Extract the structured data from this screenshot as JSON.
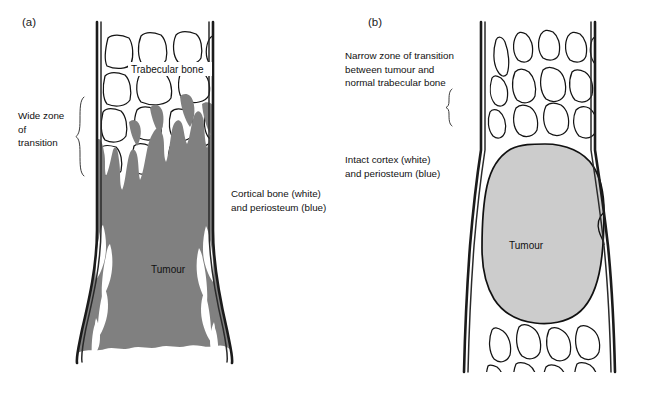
{
  "figure": {
    "background_color": "#ffffff"
  },
  "colors": {
    "tumour_aggressive_fill": "#808080",
    "tumour_benign_fill": "#cccccc",
    "cortex_stroke": "#1b1b1b",
    "trabecula_stroke": "#141414",
    "text": "#111111",
    "panel_label": "#1a1a1a",
    "brace": "#3a3a3a"
  },
  "panels": [
    {
      "id": "a",
      "label": "(a)",
      "label_x": 22,
      "label_y": 26,
      "description": "Aggressive lesion with wide zone of transition and cortical destruction",
      "annotations": [
        {
          "name": "wide-zone-of-transition",
          "lines": [
            "Wide zone",
            "of",
            "transition"
          ],
          "x": 18,
          "y": 119,
          "line_height": 13.5,
          "brace": {
            "x": 78,
            "y_top": 97,
            "y_bottom": 178
          }
        },
        {
          "name": "trabecular-bone",
          "lines": [
            "Trabecular bone"
          ],
          "x": 131,
          "y": 73,
          "line_height": 13.5,
          "brace": null
        },
        {
          "name": "cortical-bone-and-periosteum",
          "lines": [
            "Cortical bone (white)",
            "and periosteum (blue)"
          ],
          "x": 231,
          "y": 197,
          "line_height": 13.5,
          "brace": null
        },
        {
          "name": "tumour-label",
          "lines": [
            "Tumour"
          ],
          "x": 151,
          "y": 273,
          "line_height": 13.5,
          "brace": null
        }
      ]
    },
    {
      "id": "b",
      "label": "(b)",
      "label_x": 368,
      "label_y": 26,
      "description": "Benign lesion with narrow zone of transition and intact cortex",
      "annotations": [
        {
          "name": "narrow-zone-of-transition",
          "lines": [
            "Narrow zone of transition",
            "between tumour and",
            "normal trabecular bone"
          ],
          "x": 345,
          "y": 59,
          "line_height": 13.5,
          "brace": {
            "x": 449,
            "y_top": 88,
            "y_bottom": 120
          }
        },
        {
          "name": "intact-cortex-and-periosteum",
          "lines": [
            "Intact cortex (white)",
            "and periosteum (blue)"
          ],
          "x": 345,
          "y": 163,
          "line_height": 13.5,
          "brace": null
        },
        {
          "name": "tumour-label",
          "lines": [
            "Tumour"
          ],
          "x": 509,
          "y": 249,
          "line_height": 13.5,
          "brace": null
        }
      ]
    }
  ]
}
